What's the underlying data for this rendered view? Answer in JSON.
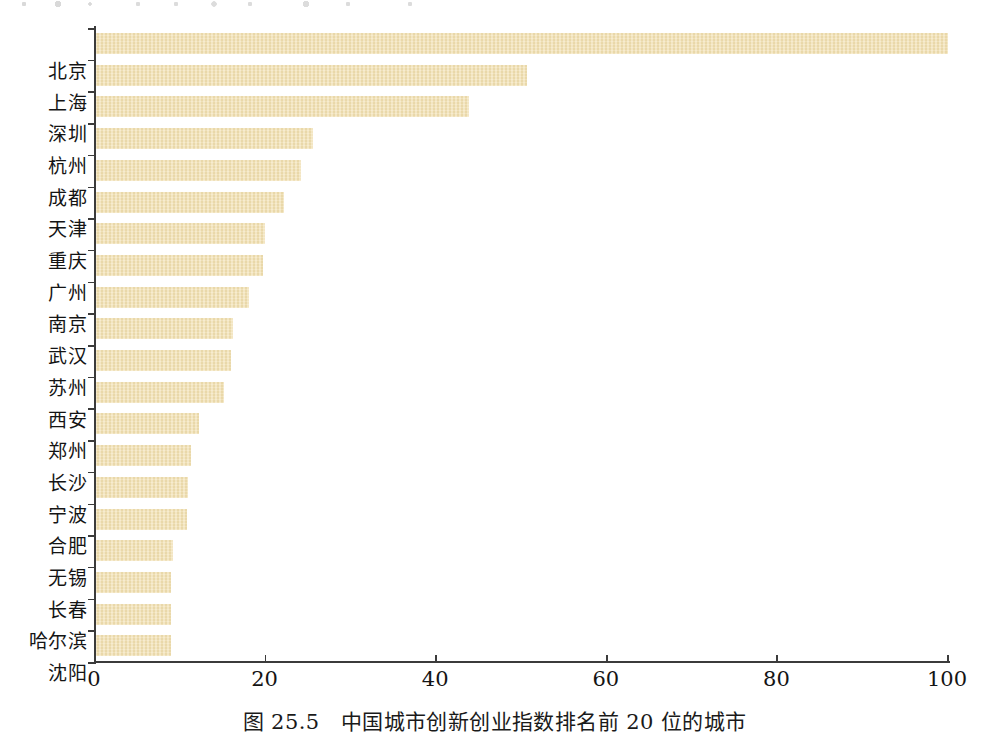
{
  "figure": {
    "caption": "图 25.5　中国城市创新创业指数排名前 20 位的城市",
    "bar_color": "#F2DFAF",
    "axis_color": "#3B3B3B",
    "background": "#FFFFFF"
  },
  "chart_data": {
    "type": "bar",
    "orientation": "horizontal",
    "title": "图 25.5　中国城市创新创业指数排名前 20 位的城市",
    "xlabel": "",
    "ylabel": "",
    "xlim": [
      0,
      100
    ],
    "xticks": [
      "0",
      "20",
      "40",
      "60",
      "80",
      "100"
    ],
    "xtick_values": [
      0,
      20,
      40,
      60,
      80,
      100
    ],
    "grid": false,
    "legend": null,
    "categories": [
      "北京",
      "上海",
      "深圳",
      "杭州",
      "成都",
      "天津",
      "重庆",
      "广州",
      "南京",
      "武汉",
      "苏州",
      "西安",
      "郑州",
      "长沙",
      "宁波",
      "合肥",
      "无锡",
      "长春",
      "哈尔滨",
      "沈阳"
    ],
    "values": [
      100.0,
      50.7,
      43.8,
      25.6,
      24.1,
      22.2,
      19.9,
      19.7,
      18.1,
      16.2,
      16.0,
      15.1,
      12.2,
      11.2,
      10.9,
      10.8,
      9.1,
      8.9,
      8.9,
      8.9
    ]
  }
}
